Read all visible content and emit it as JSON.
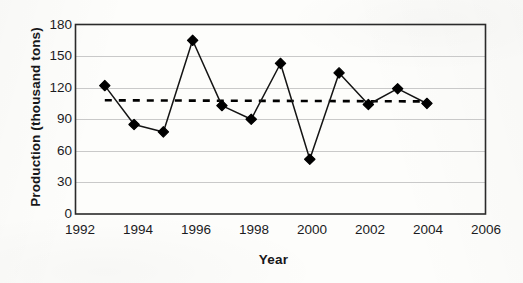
{
  "chart_data": {
    "type": "line",
    "title": "",
    "xlabel": "Year",
    "ylabel": "Production (thousand tons)",
    "x": [
      1993,
      1994,
      1995,
      1996,
      1997,
      1998,
      1999,
      2000,
      2001,
      2002,
      2003,
      2004
    ],
    "values": [
      122,
      85,
      78,
      165,
      103,
      90,
      143,
      52,
      134,
      104,
      119,
      105
    ],
    "series": [
      {
        "name": "Production",
        "marker": "filled-diamond",
        "line_style": "solid",
        "color": "#000000",
        "values": [
          122,
          85,
          78,
          165,
          103,
          90,
          143,
          52,
          134,
          104,
          119,
          105
        ]
      },
      {
        "name": "Trend",
        "marker": "none",
        "line_style": "dashed",
        "color": "#000000",
        "x": [
          1993,
          2004
        ],
        "values": [
          108,
          107
        ]
      }
    ],
    "xlim": [
      1992,
      2006
    ],
    "ylim": [
      0,
      180
    ],
    "xticks": [
      "1992",
      "1994",
      "1996",
      "1998",
      "2000",
      "2002",
      "2004",
      "2006"
    ],
    "xtick_values": [
      1992,
      1994,
      1996,
      1998,
      2000,
      2002,
      2004,
      2006
    ],
    "yticks": [
      "0",
      "30",
      "60",
      "90",
      "120",
      "150",
      "180"
    ],
    "ytick_values": [
      0,
      30,
      60,
      90,
      120,
      150,
      180
    ],
    "grid": "horizontal",
    "legend": "none",
    "plot_border": "full-rectangle",
    "colors": {
      "line": "#000000",
      "marker": "#000000",
      "gridline": "#c9c9c9",
      "border": "#2a2a2a",
      "background": "#fdfdfb",
      "text": "#1b1b1e"
    }
  }
}
